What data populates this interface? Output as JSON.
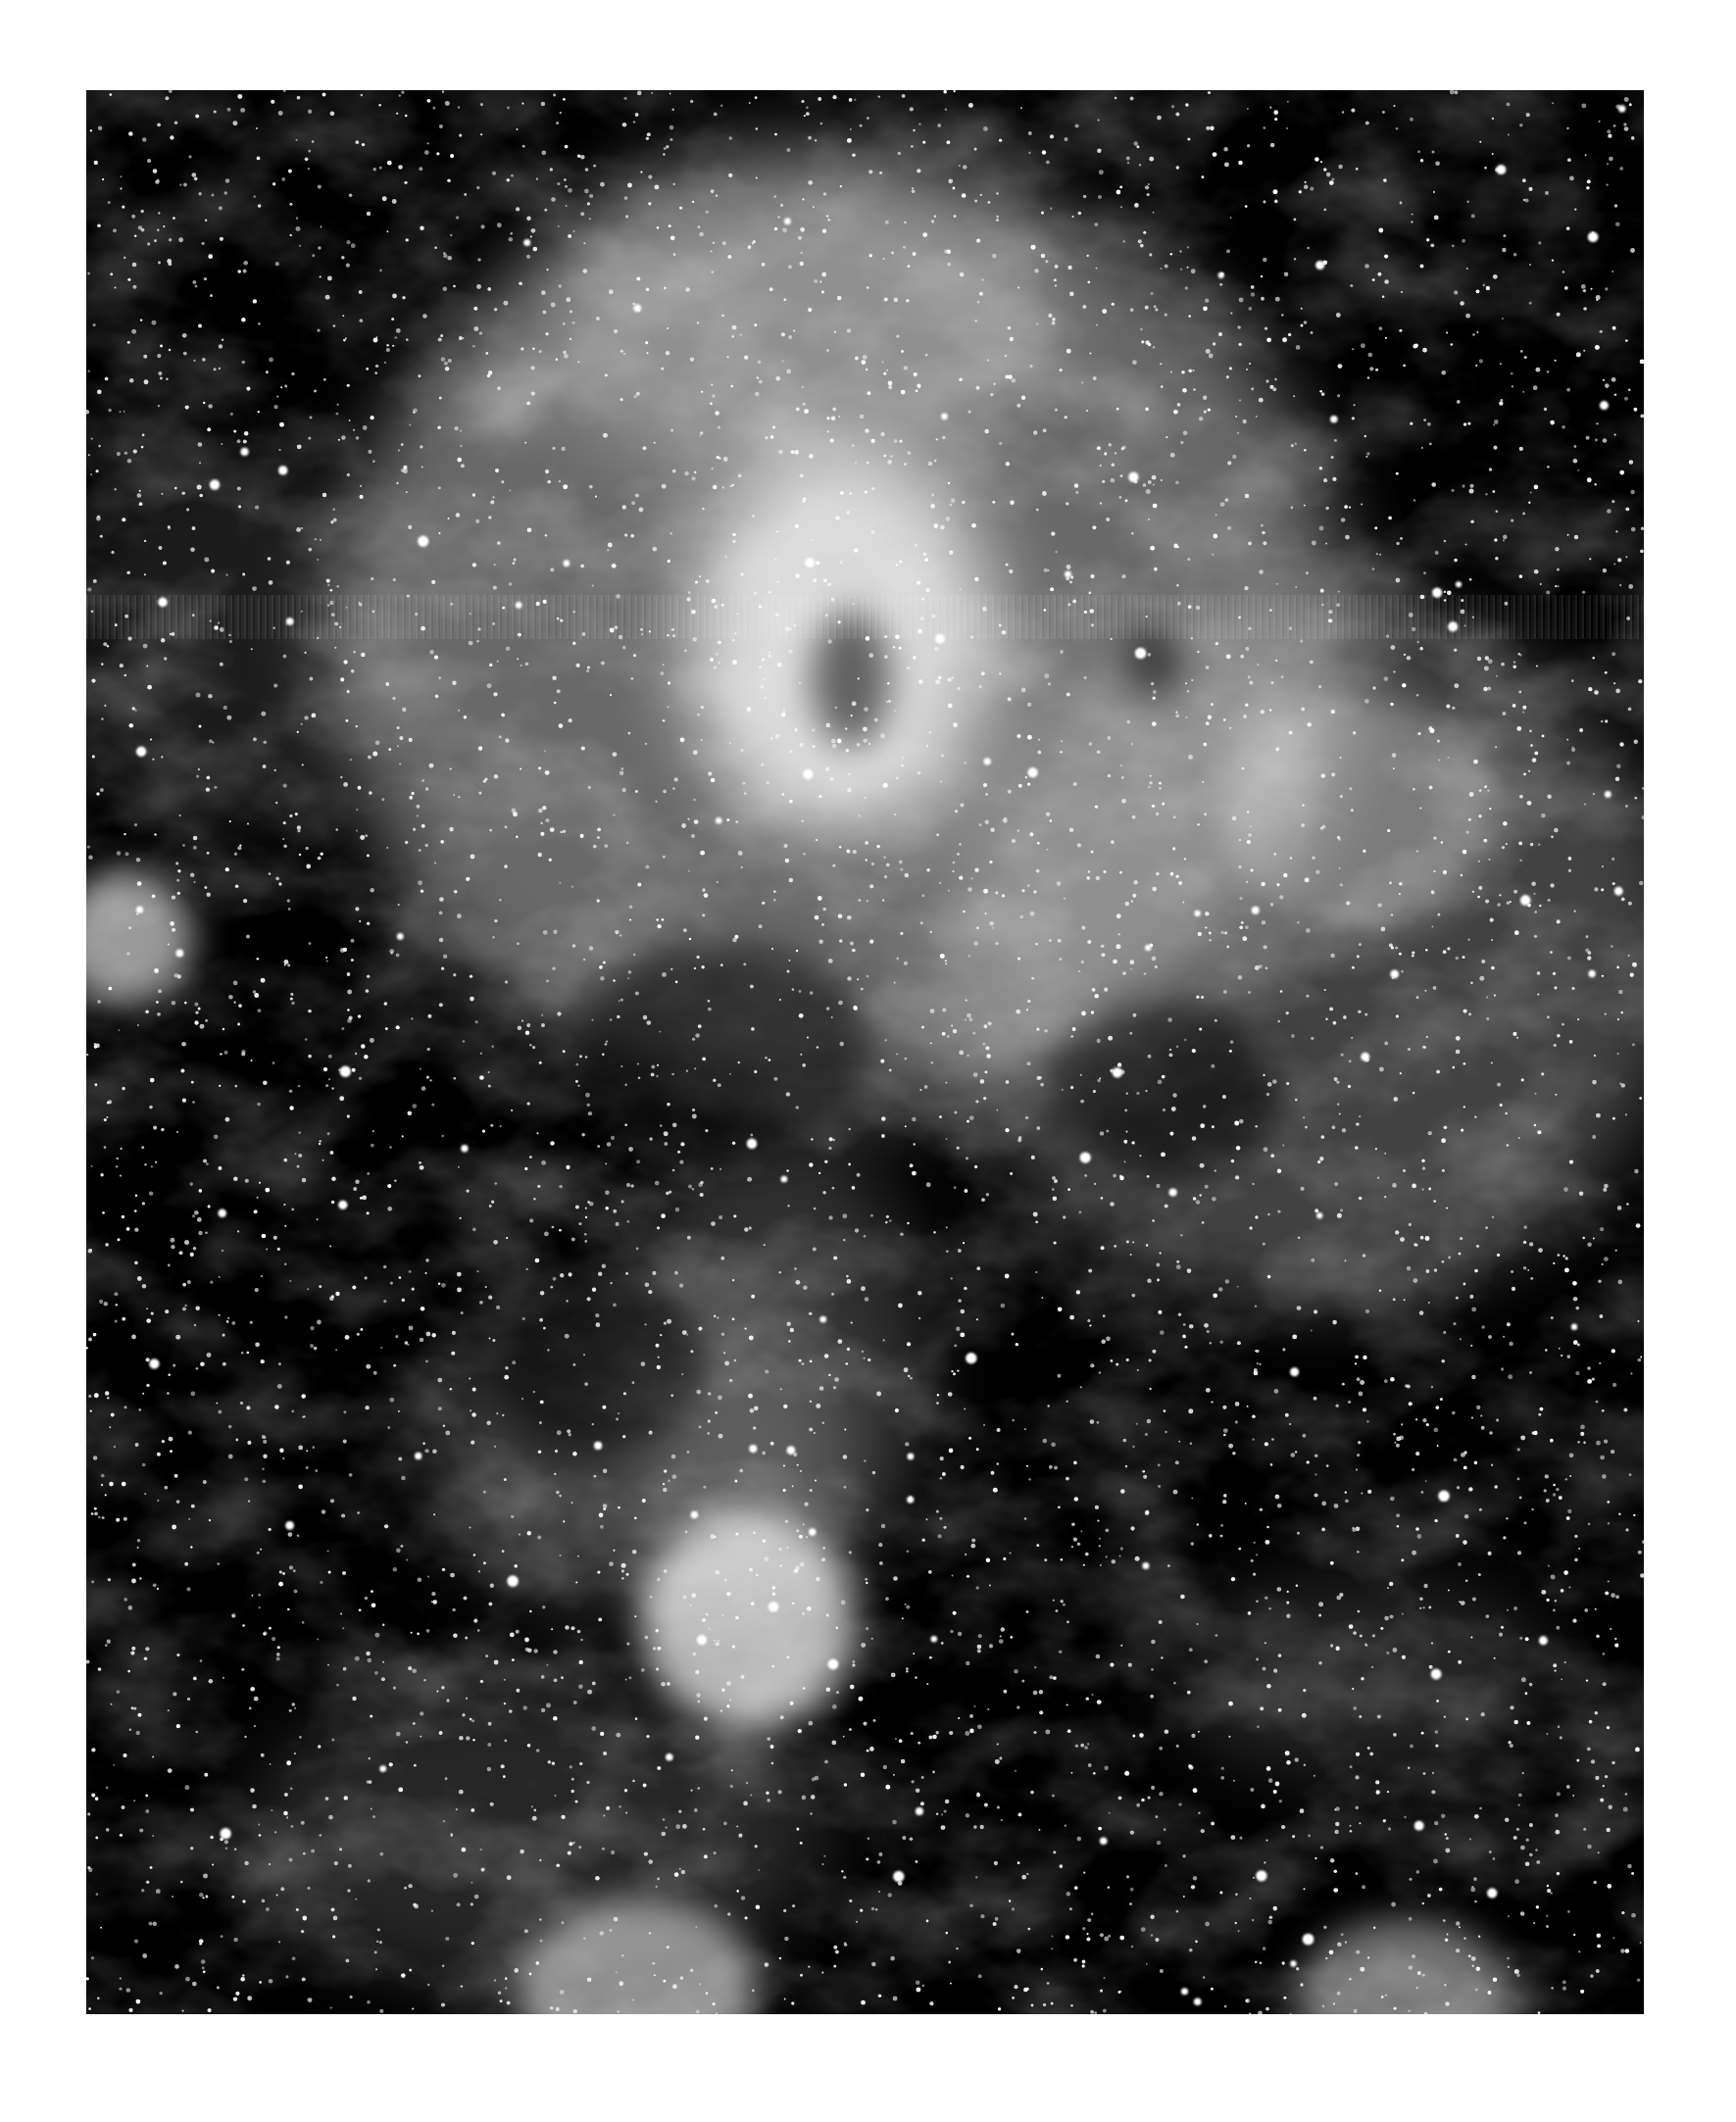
{
  "page": {
    "background": "#ffffff",
    "width": 1771,
    "height": 2165
  },
  "photo": {
    "subject": "nebula-star-field",
    "colormode": "grayscale",
    "frame": {
      "x": 88,
      "y": 92,
      "width": 1589,
      "height": 1963
    },
    "background_color": "#000000",
    "scan_streak": {
      "y": 515,
      "height": 45
    },
    "glow_regions": [
      {
        "name": "central-core",
        "cx": 770,
        "cy": 560,
        "rx": 520,
        "ry": 480,
        "intensity": 0.55
      },
      {
        "name": "core-hotspot",
        "cx": 770,
        "cy": 560,
        "rx": 160,
        "ry": 200,
        "intensity": 1.0
      },
      {
        "name": "upper-filaments",
        "cx": 720,
        "cy": 230,
        "rx": 260,
        "ry": 180,
        "intensity": 0.35
      },
      {
        "name": "right-cloud",
        "cx": 1250,
        "cy": 880,
        "rx": 380,
        "ry": 360,
        "intensity": 0.35
      },
      {
        "name": "right-cluster",
        "cx": 1300,
        "cy": 740,
        "rx": 140,
        "ry": 120,
        "intensity": 0.4
      },
      {
        "name": "lower-shell",
        "cx": 560,
        "cy": 1390,
        "rx": 220,
        "ry": 160,
        "intensity": 0.3
      },
      {
        "name": "lower-bright-knot",
        "cx": 675,
        "cy": 1560,
        "rx": 110,
        "ry": 110,
        "intensity": 0.95
      },
      {
        "name": "lower-filament",
        "cx": 700,
        "cy": 1300,
        "rx": 160,
        "ry": 240,
        "intensity": 0.25
      },
      {
        "name": "left-cluster",
        "cx": 40,
        "cy": 865,
        "rx": 70,
        "ry": 70,
        "intensity": 0.8
      },
      {
        "name": "bottom-left-knot",
        "cx": 565,
        "cy": 1935,
        "rx": 120,
        "ry": 90,
        "intensity": 0.7
      },
      {
        "name": "bottom-right-knot",
        "cx": 1345,
        "cy": 1945,
        "rx": 110,
        "ry": 80,
        "intensity": 0.6
      },
      {
        "name": "bottom-filaments",
        "cx": 460,
        "cy": 1780,
        "rx": 300,
        "ry": 160,
        "intensity": 0.2
      },
      {
        "name": "right-lower-wisp",
        "cx": 1300,
        "cy": 1620,
        "rx": 200,
        "ry": 100,
        "intensity": 0.2
      },
      {
        "name": "left-wisps",
        "cx": 140,
        "cy": 560,
        "rx": 160,
        "ry": 200,
        "intensity": 0.15
      },
      {
        "name": "small-blob-upper-left",
        "cx": 430,
        "cy": 320,
        "rx": 40,
        "ry": 30,
        "intensity": 0.4
      }
    ],
    "dark_lanes": [
      {
        "cx": 780,
        "cy": 600,
        "rx": 40,
        "ry": 70
      },
      {
        "cx": 650,
        "cy": 980,
        "rx": 150,
        "ry": 110
      },
      {
        "cx": 1100,
        "cy": 1020,
        "rx": 120,
        "ry": 90
      },
      {
        "cx": 520,
        "cy": 1300,
        "rx": 110,
        "ry": 90
      },
      {
        "cx": 1090,
        "cy": 580,
        "rx": 30,
        "ry": 40
      }
    ],
    "star_field": {
      "seed": 42,
      "count": 5200,
      "bright_count": 90
    }
  }
}
